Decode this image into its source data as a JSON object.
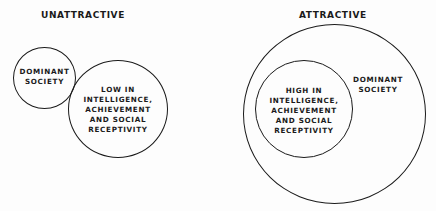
{
  "panels": [
    {
      "title": "UNATTRACTIVE",
      "circles": [
        {
          "name": "dominant-society",
          "lines": [
            "DOMINANT",
            "SOCIETY"
          ]
        },
        {
          "name": "minority-group",
          "lines": [
            "LOW IN",
            "INTELLIGENCE,",
            "ACHIEVEMENT",
            "AND SOCIAL",
            "RECEPTIVITY"
          ]
        }
      ]
    },
    {
      "title": "ATTRACTIVE",
      "circles": [
        {
          "name": "dominant-society",
          "lines": [
            "DOMINANT",
            "SOCIETY"
          ]
        },
        {
          "name": "minority-group",
          "lines": [
            "HIGH IN",
            "INTELLIGENCE,",
            "ACHIEVEMENT",
            "AND SOCIAL",
            "RECEPTIVITY"
          ]
        }
      ]
    }
  ],
  "colors": {
    "background": "#fdfdfd",
    "ink": "#1a1a1a"
  }
}
